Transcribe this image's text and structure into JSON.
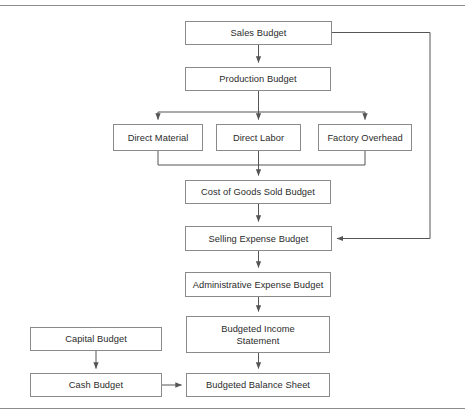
{
  "diagram": {
    "canvas": {
      "width": 465,
      "height": 420
    },
    "colors": {
      "box_border": "#8a8a8a",
      "box_fill": "#ffffff",
      "connector": "#555555",
      "text": "#2b2b2b",
      "page_rule": "#8d8d8d"
    },
    "rules": [
      {
        "name": "top-rule",
        "y": 5
      },
      {
        "name": "bottom-rule",
        "y": 408
      }
    ],
    "nodes": [
      {
        "id": "sales-budget",
        "label": "Sales Budget",
        "x": 185,
        "y": 21,
        "w": 147,
        "h": 24
      },
      {
        "id": "production-budget",
        "label": "Production Budget",
        "x": 185,
        "y": 67,
        "w": 146,
        "h": 24
      },
      {
        "id": "direct-material",
        "label": "Direct Material",
        "x": 113,
        "y": 124,
        "w": 90,
        "h": 27
      },
      {
        "id": "direct-labor",
        "label": "Direct Labor",
        "x": 216,
        "y": 124,
        "w": 85,
        "h": 27
      },
      {
        "id": "factory-overhead",
        "label": "Factory Overhead",
        "x": 318,
        "y": 124,
        "w": 94,
        "h": 27
      },
      {
        "id": "cost-of-goods-sold-budget",
        "label": "Cost of Goods Sold Budget",
        "x": 185,
        "y": 180,
        "w": 146,
        "h": 24
      },
      {
        "id": "selling-expense-budget",
        "label": "Selling Expense Budget",
        "x": 185,
        "y": 226,
        "w": 147,
        "h": 25
      },
      {
        "id": "administrative-expense-budget",
        "label": "Administrative Expense Budget",
        "x": 185,
        "y": 272,
        "w": 146,
        "h": 25
      },
      {
        "id": "budgeted-income-statement",
        "label": "Budgeted Income\nStatement",
        "x": 186,
        "y": 316,
        "w": 144,
        "h": 37
      },
      {
        "id": "capital-budget",
        "label": "Capital Budget",
        "x": 30,
        "y": 327,
        "w": 132,
        "h": 24
      },
      {
        "id": "cash-budget",
        "label": "Cash Budget",
        "x": 30,
        "y": 373,
        "w": 132,
        "h": 24
      },
      {
        "id": "budgeted-balance-sheet",
        "label": "Budgeted Balance Sheet",
        "x": 186,
        "y": 373,
        "w": 144,
        "h": 24
      }
    ],
    "edges": [
      {
        "id": "sales-to-production",
        "from": "sales-budget",
        "to": "production-budget",
        "style": "straight-down",
        "arrow": true
      },
      {
        "id": "sales-to-selling-expense",
        "from": "sales-budget",
        "to": "selling-expense-budget",
        "style": "right-loop",
        "arrow": true
      },
      {
        "id": "production-to-direct-material",
        "from": "production-budget",
        "to": "direct-material",
        "style": "branch-down",
        "arrow": true
      },
      {
        "id": "production-to-direct-labor",
        "from": "production-budget",
        "to": "direct-labor",
        "style": "branch-down",
        "arrow": true
      },
      {
        "id": "production-to-factory-overhead",
        "from": "production-budget",
        "to": "factory-overhead",
        "style": "branch-down",
        "arrow": true
      },
      {
        "id": "direct-material-to-cogs",
        "from": "direct-material",
        "to": "cost-of-goods-sold-budget",
        "style": "merge-down",
        "arrow": true
      },
      {
        "id": "direct-labor-to-cogs",
        "from": "direct-labor",
        "to": "cost-of-goods-sold-budget",
        "style": "merge-down",
        "arrow": true
      },
      {
        "id": "factory-overhead-to-cogs",
        "from": "factory-overhead",
        "to": "cost-of-goods-sold-budget",
        "style": "merge-down",
        "arrow": true
      },
      {
        "id": "cogs-to-selling-expense",
        "from": "cost-of-goods-sold-budget",
        "to": "selling-expense-budget",
        "style": "straight-down",
        "arrow": true
      },
      {
        "id": "selling-to-administrative",
        "from": "selling-expense-budget",
        "to": "administrative-expense-budget",
        "style": "straight-down",
        "arrow": true
      },
      {
        "id": "administrative-to-income",
        "from": "administrative-expense-budget",
        "to": "budgeted-income-statement",
        "style": "straight-down",
        "arrow": true
      },
      {
        "id": "income-to-balance-sheet",
        "from": "budgeted-income-statement",
        "to": "budgeted-balance-sheet",
        "style": "straight-down",
        "arrow": true
      },
      {
        "id": "capital-to-cash",
        "from": "capital-budget",
        "to": "cash-budget",
        "style": "straight-down",
        "arrow": true
      },
      {
        "id": "cash-to-balance-sheet",
        "from": "cash-budget",
        "to": "budgeted-balance-sheet",
        "style": "straight-right",
        "arrow": true
      }
    ]
  }
}
